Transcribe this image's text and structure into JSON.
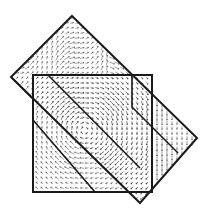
{
  "figure": {
    "background": "#ffffff",
    "line_color": "#1a1a1a",
    "arrow_color": "#555555",
    "shapes": {
      "rotated_rectangle": [
        [
          72,
          16
        ],
        [
          197,
          138
        ],
        [
          140,
          203
        ],
        [
          11,
          77
        ]
      ],
      "upright_square": [
        [
          33,
          75
        ],
        [
          152,
          75
        ],
        [
          152,
          192
        ],
        [
          33,
          192
        ]
      ],
      "inner_lines": [
        [
          [
            48,
            75
          ],
          [
            132,
            75
          ]
        ],
        [
          [
            132,
            75
          ],
          [
            132,
            107
          ]
        ],
        [
          [
            11,
            77
          ],
          [
            33,
            99
          ]
        ],
        [
          [
            48,
            75
          ],
          [
            140,
            168
          ]
        ],
        [
          [
            33,
            120
          ],
          [
            95,
            192
          ]
        ],
        [
          [
            132,
            107
          ],
          [
            178,
            153
          ]
        ]
      ]
    },
    "arrow_fields": [
      {
        "name": "upper-left-band",
        "cx": 60,
        "cy": 60,
        "angle": -45,
        "density": "high"
      },
      {
        "name": "center-vortex",
        "cx": 85,
        "cy": 130,
        "angle": -40,
        "density": "high"
      },
      {
        "name": "right-band",
        "cx": 160,
        "cy": 130,
        "angle": 90,
        "density": "high"
      },
      {
        "name": "lower-band",
        "cx": 130,
        "cy": 170,
        "angle": 45,
        "density": "medium"
      }
    ]
  }
}
